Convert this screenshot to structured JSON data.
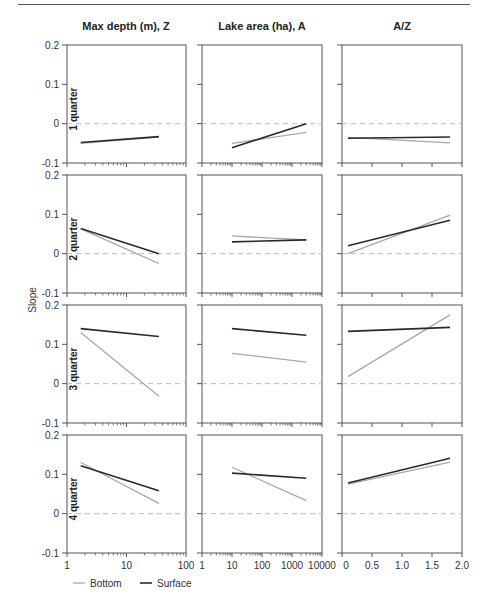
{
  "figure": {
    "ylabel": "Slope",
    "columns": [
      "Max depth (m), Z",
      "Lake area (ha), A",
      "A/Z"
    ],
    "rows": [
      "1 quarter",
      "2 quarter",
      "3 quarter",
      "4 quarter"
    ],
    "y_ticks": [
      "0.2",
      "0.1",
      "0",
      "-0.1"
    ],
    "x_ticks": [
      [
        "1",
        "10",
        "100"
      ],
      [
        "1",
        "10",
        "100",
        "1000",
        "10000"
      ],
      [
        "0",
        "0.5",
        "1.0",
        "1.5",
        "2.0"
      ]
    ],
    "legend": [
      {
        "label": "Bottom",
        "color": "#a8a8a8"
      },
      {
        "label": "Surface",
        "color": "#2a2a2a"
      }
    ]
  },
  "chart_data": {
    "type": "line",
    "title": "",
    "ylabel": "Slope",
    "ylim": [
      -0.1,
      0.2
    ],
    "grid": false,
    "reference_line": {
      "y": 0,
      "style": "dashed"
    },
    "legend_position": "bottom-left",
    "series_names": [
      "Bottom",
      "Surface"
    ],
    "panels": [
      {
        "row": "1 quarter",
        "column": "Max depth (m), Z",
        "xscale": "log",
        "xlim": [
          1,
          100
        ],
        "Bottom": {
          "x": [
            1.7,
            35
          ],
          "y": [
            -0.05,
            -0.034
          ]
        },
        "Surface": {
          "x": [
            1.7,
            35
          ],
          "y": [
            -0.048,
            -0.033
          ]
        }
      },
      {
        "row": "1 quarter",
        "column": "Lake area (ha), A",
        "xscale": "log",
        "xlim": [
          1,
          10000
        ],
        "Bottom": {
          "x": [
            10,
            3000
          ],
          "y": [
            -0.05,
            -0.022
          ]
        },
        "Surface": {
          "x": [
            10,
            3000
          ],
          "y": [
            -0.061,
            0.0
          ]
        }
      },
      {
        "row": "1 quarter",
        "column": "A/Z",
        "xscale": "linear",
        "xlim": [
          0,
          2.0
        ],
        "Bottom": {
          "x": [
            0.1,
            1.8
          ],
          "y": [
            -0.035,
            -0.049
          ]
        },
        "Surface": {
          "x": [
            0.1,
            1.8
          ],
          "y": [
            -0.037,
            -0.034
          ]
        }
      },
      {
        "row": "2 quarter",
        "column": "Max depth (m), Z",
        "xscale": "log",
        "xlim": [
          1,
          100
        ],
        "Bottom": {
          "x": [
            1.7,
            35
          ],
          "y": [
            0.063,
            -0.025
          ]
        },
        "Surface": {
          "x": [
            1.7,
            35
          ],
          "y": [
            0.064,
            0.0
          ]
        }
      },
      {
        "row": "2 quarter",
        "column": "Lake area (ha), A",
        "xscale": "log",
        "xlim": [
          1,
          10000
        ],
        "Bottom": {
          "x": [
            10,
            3000
          ],
          "y": [
            0.045,
            0.035
          ]
        },
        "Surface": {
          "x": [
            10,
            3000
          ],
          "y": [
            0.03,
            0.035
          ]
        }
      },
      {
        "row": "2 quarter",
        "column": "A/Z",
        "xscale": "linear",
        "xlim": [
          0,
          2.0
        ],
        "Bottom": {
          "x": [
            0.1,
            1.8
          ],
          "y": [
            0.0,
            0.098
          ]
        },
        "Surface": {
          "x": [
            0.1,
            1.8
          ],
          "y": [
            0.02,
            0.085
          ]
        }
      },
      {
        "row": "3 quarter",
        "column": "Max depth (m), Z",
        "xscale": "log",
        "xlim": [
          1,
          100
        ],
        "Bottom": {
          "x": [
            1.7,
            35
          ],
          "y": [
            0.13,
            -0.032
          ]
        },
        "Surface": {
          "x": [
            1.7,
            35
          ],
          "y": [
            0.14,
            0.12
          ]
        }
      },
      {
        "row": "3 quarter",
        "column": "Lake area (ha), A",
        "xscale": "log",
        "xlim": [
          1,
          10000
        ],
        "Bottom": {
          "x": [
            10,
            3000
          ],
          "y": [
            0.077,
            0.055
          ]
        },
        "Surface": {
          "x": [
            10,
            3000
          ],
          "y": [
            0.14,
            0.123
          ]
        }
      },
      {
        "row": "3 quarter",
        "column": "A/Z",
        "xscale": "linear",
        "xlim": [
          0,
          2.0
        ],
        "Bottom": {
          "x": [
            0.1,
            1.8
          ],
          "y": [
            0.018,
            0.175
          ]
        },
        "Surface": {
          "x": [
            0.1,
            1.8
          ],
          "y": [
            0.133,
            0.143
          ]
        }
      },
      {
        "row": "4 quarter",
        "column": "Max depth (m), Z",
        "xscale": "log",
        "xlim": [
          1,
          100
        ],
        "Bottom": {
          "x": [
            1.7,
            35
          ],
          "y": [
            0.13,
            0.026
          ]
        },
        "Surface": {
          "x": [
            1.7,
            35
          ],
          "y": [
            0.122,
            0.058
          ]
        }
      },
      {
        "row": "4 quarter",
        "column": "Lake area (ha), A",
        "xscale": "log",
        "xlim": [
          1,
          10000
        ],
        "Bottom": {
          "x": [
            10,
            3000
          ],
          "y": [
            0.118,
            0.033
          ]
        },
        "Surface": {
          "x": [
            10,
            3000
          ],
          "y": [
            0.103,
            0.09
          ]
        }
      },
      {
        "row": "4 quarter",
        "column": "A/Z",
        "xscale": "linear",
        "xlim": [
          0,
          2.0
        ],
        "Bottom": {
          "x": [
            0.1,
            1.8
          ],
          "y": [
            0.075,
            0.131
          ]
        },
        "Surface": {
          "x": [
            0.1,
            1.8
          ],
          "y": [
            0.078,
            0.141
          ]
        }
      }
    ]
  }
}
